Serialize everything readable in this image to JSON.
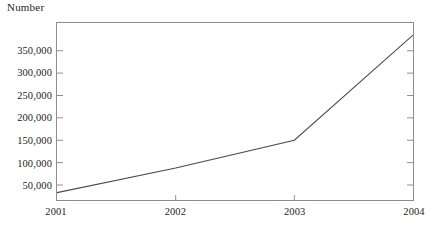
{
  "chart_data": {
    "type": "line",
    "title": "",
    "xlabel": "",
    "ylabel": "Number",
    "categories": [
      "2001",
      "2002",
      "2003",
      "2004"
    ],
    "x": [
      2001,
      2002,
      2003,
      2004
    ],
    "values": [
      33000,
      88000,
      150000,
      385000
    ],
    "series": [
      {
        "name": "Number",
        "values": [
          33000,
          88000,
          150000,
          385000
        ]
      }
    ],
    "ylim": [
      16500,
      412000
    ],
    "xlim": [
      2001,
      2004
    ],
    "y_ticks": [
      50000,
      100000,
      150000,
      200000,
      250000,
      300000,
      350000
    ],
    "y_tick_labels": [
      "50,000",
      "100,000",
      "150,000",
      "200,000",
      "250,000",
      "300,000",
      "350,000"
    ],
    "x_ticks": [
      2001,
      2002,
      2003,
      2004
    ],
    "x_tick_labels": [
      "2001",
      "2002",
      "2003",
      "2004"
    ],
    "grid": false,
    "legend": false,
    "legend_position": "none",
    "line_color": "#4a4a4a",
    "frame_color": "#8e8e8e",
    "background_color": "#ffffff",
    "tick_side": "both-inward"
  },
  "axes": {
    "y_title": "Number"
  }
}
